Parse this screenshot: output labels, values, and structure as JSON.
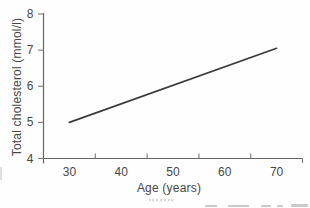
{
  "figure": {
    "background": "#fefefe",
    "line_ink": "#3a3a3a",
    "axis_ink": "#646464",
    "tick_ink": "#787878",
    "text_ink": "#474747"
  },
  "chart_data": {
    "type": "line",
    "title": "",
    "xlabel": "Age (years)",
    "ylabel": "Total cholesterol (mmol/l)",
    "xlim": [
      25,
      75
    ],
    "ylim": [
      4,
      8
    ],
    "x_tick_labels": [
      30,
      40,
      50,
      60,
      70
    ],
    "x_tick_marks": [
      35,
      45,
      55,
      65,
      75
    ],
    "y_tick_labels": [
      4,
      5,
      6,
      7,
      8
    ],
    "grid": false,
    "legend": "none",
    "series": [
      {
        "name": "cholesterol-vs-age-line",
        "x": [
          30,
          70
        ],
        "y": [
          5.0,
          7.05
        ]
      }
    ]
  }
}
